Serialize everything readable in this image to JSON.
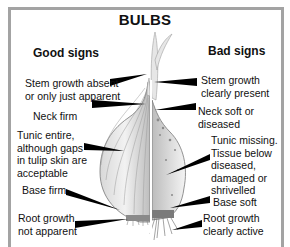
{
  "title": "BULBS",
  "good": {
    "heading": "Good signs",
    "labels": [
      {
        "line1": "Stem growth absent",
        "line2": "or only just apparent"
      },
      {
        "line1": "Neck firm"
      },
      {
        "line1": "Tunic entire,",
        "line2": "although gaps",
        "line3": "in tulip skin are",
        "line4": "acceptable"
      },
      {
        "line1": "Base firm"
      },
      {
        "line1": "Root growth",
        "line2": "not apparent"
      }
    ]
  },
  "bad": {
    "heading": "Bad signs",
    "labels": [
      {
        "line1": "Stem growth",
        "line2": "clearly present"
      },
      {
        "line1": "Neck soft or",
        "line2": "diseased"
      },
      {
        "line1": "Tunic missing.",
        "line2": "Tissue below",
        "line3": "diseased,",
        "line4": "damaged or",
        "line5": "shrivelled"
      },
      {
        "line1": "Base soft"
      },
      {
        "line1": "Root growth",
        "line2": "clearly active"
      }
    ]
  },
  "colors": {
    "frame": "#a3a3a3",
    "text": "#111111",
    "pointer": "#000000"
  }
}
